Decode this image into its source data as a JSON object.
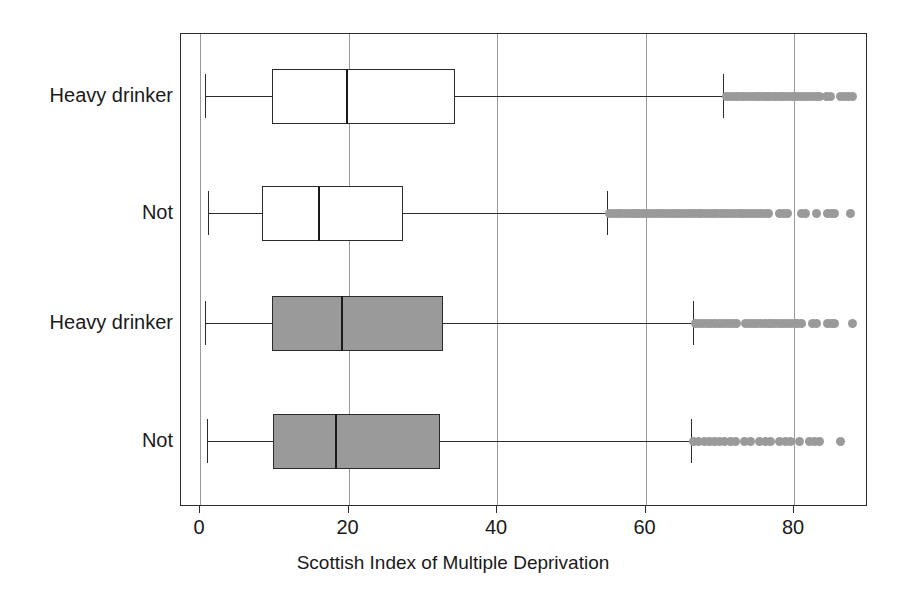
{
  "chart_data": {
    "type": "box",
    "title": "",
    "xlabel": "Scottish Index of Multiple Deprivation",
    "ylabel": "",
    "xlim": [
      -1.8,
      90.5
    ],
    "xticks": [
      0,
      20,
      40,
      60,
      80
    ],
    "xticklabels": [
      "0",
      "20",
      "40",
      "60",
      "80"
    ],
    "grid": "vertical gridlines at each x tick",
    "orientation": "horizontal",
    "legend": "none",
    "colors": {
      "box_fill_group_a": "#ffffff",
      "box_fill_group_b": "#9a9a9a",
      "line": "#2b2b2b",
      "outlier": "#9a9a9a",
      "grid": "#9a9a9a"
    },
    "categories": [
      "Heavy drinker",
      "Not",
      "Heavy drinker",
      "Not"
    ],
    "boxes": [
      {
        "label": "Heavy drinker",
        "fill": "#ffffff",
        "whisker_low": 0.7,
        "q1": 9.7,
        "median": 19.7,
        "q3": 34.3,
        "whisker_high": 70.5,
        "outliers": [
          70.9,
          71.5,
          72.0,
          72.4,
          72.9,
          73.4,
          73.9,
          74.4,
          74.9,
          75.4,
          75.9,
          76.3,
          76.7,
          77.2,
          77.7,
          78.2,
          78.6,
          79.1,
          79.6,
          80.1,
          80.5,
          81.0,
          81.5,
          82.0,
          82.5,
          83.0,
          83.5,
          84.4,
          84.9,
          86.2,
          86.8,
          87.4,
          87.9
        ]
      },
      {
        "label": "Not",
        "fill": "#ffffff",
        "whisker_low": 1.1,
        "q1": 8.3,
        "median": 15.9,
        "q3": 27.3,
        "whisker_high": 54.8,
        "outliers": [
          55.2,
          55.7,
          56.2,
          56.7,
          57.2,
          57.7,
          58.2,
          58.7,
          59.1,
          59.6,
          60.1,
          60.6,
          61.1,
          61.6,
          62.1,
          62.6,
          63.1,
          63.6,
          64.1,
          64.6,
          65.1,
          65.6,
          66.1,
          66.6,
          67.1,
          67.6,
          68.1,
          68.6,
          69.1,
          69.6,
          70.1,
          70.6,
          71.1,
          71.6,
          72.1,
          72.6,
          73.1,
          73.6,
          74.1,
          74.6,
          75.1,
          75.6,
          76.1,
          76.6,
          78.1,
          78.6,
          79.1,
          81.0,
          81.6,
          83.0,
          84.5,
          85.0,
          85.5,
          87.6
        ]
      },
      {
        "label": "Heavy drinker",
        "fill": "#9a9a9a",
        "whisker_low": 0.7,
        "q1": 9.7,
        "median": 19.0,
        "q3": 32.7,
        "whisker_high": 66.4,
        "outliers": [
          66.8,
          67.3,
          67.8,
          68.3,
          68.8,
          69.3,
          69.8,
          70.3,
          70.8,
          71.3,
          71.8,
          72.3,
          73.5,
          74.0,
          74.5,
          75.0,
          75.5,
          76.0,
          76.5,
          77.0,
          77.5,
          78.0,
          78.5,
          79.0,
          79.5,
          80.0,
          80.5,
          81.0,
          82.5,
          83.0,
          84.5,
          85.0,
          85.5,
          87.9
        ]
      },
      {
        "label": "Not",
        "fill": "#9a9a9a",
        "whisker_low": 1.0,
        "q1": 9.8,
        "median": 18.2,
        "q3": 32.3,
        "whisker_high": 66.1,
        "outliers": [
          66.5,
          67.2,
          67.9,
          68.6,
          69.3,
          70.0,
          70.7,
          71.4,
          72.1,
          73.4,
          74.1,
          75.4,
          76.1,
          76.8,
          78.1,
          78.8,
          79.5,
          80.8,
          82.1,
          82.8,
          83.5,
          86.2
        ]
      }
    ]
  },
  "axis": {
    "x_title": "Scottish Index of Multiple Deprivation",
    "tick_labels": [
      "0",
      "20",
      "40",
      "60",
      "80"
    ]
  },
  "category_labels": [
    "Heavy drinker",
    "Not",
    "Heavy drinker",
    "Not"
  ]
}
